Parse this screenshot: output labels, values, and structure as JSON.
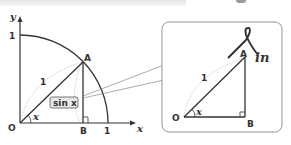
{
  "diagram": {
    "left": {
      "axis_x_label": "x",
      "axis_y_label": "y",
      "origin_label": "O",
      "y_tick": "1",
      "x_tick": "1",
      "point_a": "A",
      "point_b": "B",
      "hypotenuse_label": "1",
      "angle_label": "x",
      "sin_box_label": "sin x"
    },
    "callout": {
      "point_a": "A",
      "point_b": "B",
      "origin_label": "O",
      "hypotenuse_label": "1",
      "angle_label": "x",
      "script_label": "in"
    },
    "colors": {
      "line": "#333333",
      "dotted": "#aaaaaa",
      "box_fill": "#e8e8e8",
      "callout_border": "#888888"
    }
  }
}
